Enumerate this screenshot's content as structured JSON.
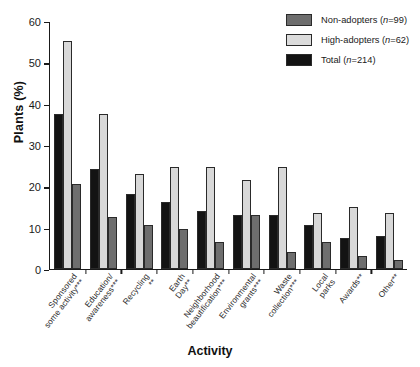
{
  "chart_data": {
    "type": "bar",
    "title": "",
    "xlabel": "Activity",
    "ylabel": "Plants (%)",
    "ylim": [
      0,
      60
    ],
    "yticks": [
      0,
      10,
      20,
      30,
      40,
      50,
      60
    ],
    "grid": false,
    "legend_position": "top-right",
    "categories": [
      "Sponsored some activity***",
      "Education/ awareness***",
      "Recycling **",
      "Earth Day**",
      "Neighborhood beautification***",
      "Environmental grants***",
      "Waste collection***",
      "Local parks",
      "Awards**",
      "Other**"
    ],
    "series": [
      {
        "name": "Total (n=214)",
        "key": "total",
        "color": "#131313",
        "values": [
          37.5,
          24.0,
          18.0,
          16.0,
          14.0,
          13.0,
          13.0,
          10.5,
          7.5,
          8.0
        ]
      },
      {
        "name": "High-adopters (n=62)",
        "key": "high",
        "color": "#d8d8d8",
        "values": [
          55.0,
          37.5,
          23.0,
          24.5,
          24.5,
          21.5,
          24.5,
          13.5,
          15.0,
          13.5
        ]
      },
      {
        "name": "Non-adopters (n=99)",
        "key": "non",
        "color": "#6e6e6e",
        "values": [
          20.5,
          12.5,
          10.5,
          9.5,
          6.5,
          13.0,
          4.0,
          6.5,
          3.0,
          2.0
        ]
      }
    ]
  },
  "legend": {
    "items": [
      {
        "label": "Non-adopters (",
        "italic": "n",
        "suffix": "=99)",
        "swatch": "non"
      },
      {
        "label": "High-adopters (",
        "italic": "n",
        "suffix": "=62)",
        "swatch": "high"
      },
      {
        "label": "Total (",
        "italic": "n",
        "suffix": "=214)",
        "swatch": "total"
      }
    ]
  },
  "axes": {
    "y_title": "Plants (%)",
    "x_title": "Activity"
  }
}
